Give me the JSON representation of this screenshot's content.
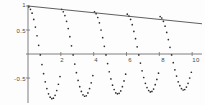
{
  "figure": {
    "title": "",
    "background": "#fdfdfd",
    "width": 205,
    "height": 105
  },
  "axes": {
    "y_axis_label_top": "1",
    "y_axis_label_half": "0.5",
    "y_axis_label_neg_half": "-0.5",
    "x_tick_2": "2",
    "x_tick_4": "4",
    "x_tick_6": "6",
    "x_tick_8": "8",
    "x_tick_10": "10",
    "axis_color": "#6f6f6f",
    "point_color": "#2e2e2e",
    "line_color": "#4d4d4d"
  },
  "chart_data": {
    "type": "scatter",
    "title": "",
    "xlabel": "",
    "ylabel": "",
    "xlim": [
      0,
      10.6
    ],
    "ylim": [
      -1.05,
      1.05
    ],
    "grid": false,
    "legend": "none",
    "xticks": [
      2,
      4,
      6,
      8,
      10
    ],
    "yticks": [
      -0.5,
      0.5,
      1
    ],
    "xticklabels": [
      "2",
      "4",
      "6",
      "8",
      "10"
    ],
    "yticklabels": [
      "-0.5",
      "0.5",
      "1"
    ],
    "annotations": [],
    "series": [
      {
        "name": "damped-oscillation-samples",
        "type": "scatter",
        "marker": "dot",
        "color": "#2e2e2e",
        "x": [
          0.05,
          0.15,
          0.25,
          0.35,
          0.45,
          0.55,
          0.65,
          0.75,
          0.85,
          0.95,
          1.05,
          1.15,
          1.25,
          1.35,
          1.45,
          1.55,
          1.65,
          1.75,
          1.85,
          1.95,
          2.05,
          2.15,
          2.25,
          2.35,
          2.45,
          2.55,
          2.65,
          2.75,
          2.85,
          2.95,
          3.05,
          3.15,
          3.25,
          3.35,
          3.45,
          3.55,
          3.65,
          3.75,
          3.85,
          3.95,
          4.05,
          4.15,
          4.25,
          4.35,
          4.45,
          4.55,
          4.65,
          4.75,
          4.85,
          4.95,
          5.05,
          5.15,
          5.25,
          5.35,
          5.45,
          5.55,
          5.65,
          5.75,
          5.85,
          5.95,
          6.05,
          6.15,
          6.25,
          6.35,
          6.45,
          6.55,
          6.65,
          6.75,
          6.85,
          6.95,
          7.05,
          7.15,
          7.25,
          7.35,
          7.45,
          7.55,
          7.65,
          7.75,
          7.85,
          7.95,
          8.05,
          8.15,
          8.25,
          8.35,
          8.45,
          8.55,
          8.65,
          8.75,
          8.85,
          8.95,
          9.05,
          9.15,
          9.25,
          9.35,
          9.45,
          9.55,
          9.65,
          9.75,
          9.85,
          9.95
        ],
        "y": [
          0.98,
          0.93,
          0.85,
          0.72,
          0.56,
          0.38,
          0.18,
          -0.02,
          -0.22,
          -0.41,
          -0.58,
          -0.72,
          -0.83,
          -0.9,
          -0.93,
          -0.92,
          -0.86,
          -0.76,
          -0.63,
          -0.47,
          0.93,
          0.88,
          0.8,
          0.68,
          0.53,
          0.36,
          0.17,
          -0.02,
          -0.21,
          -0.39,
          -0.55,
          -0.68,
          -0.78,
          -0.85,
          -0.88,
          -0.87,
          -0.81,
          -0.72,
          -0.6,
          -0.45,
          0.88,
          0.84,
          0.76,
          0.65,
          0.5,
          0.34,
          0.16,
          -0.02,
          -0.2,
          -0.37,
          -0.52,
          -0.65,
          -0.74,
          -0.81,
          -0.83,
          -0.82,
          -0.77,
          -0.68,
          -0.56,
          -0.42,
          0.83,
          0.79,
          0.72,
          0.61,
          0.47,
          0.32,
          0.15,
          -0.02,
          -0.19,
          -0.35,
          -0.49,
          -0.61,
          -0.7,
          -0.76,
          -0.79,
          -0.78,
          -0.73,
          -0.64,
          -0.53,
          -0.4,
          0.78,
          0.75,
          0.68,
          0.58,
          0.45,
          0.3,
          0.14,
          -0.02,
          -0.18,
          -0.33,
          -0.46,
          -0.58,
          -0.66,
          -0.72,
          -0.75,
          -0.74,
          -0.69,
          -0.61,
          -0.5,
          -0.38
        ]
      },
      {
        "name": "envelope-line",
        "type": "line",
        "color": "#4d4d4d",
        "x": [
          0.0,
          10.6
        ],
        "y": [
          1.0,
          0.63
        ]
      }
    ]
  }
}
